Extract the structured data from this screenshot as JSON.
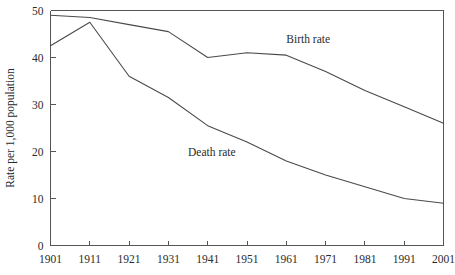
{
  "chart_data": {
    "type": "line",
    "title": "",
    "xlabel": "",
    "ylabel": "Rate per 1,000 population",
    "x": [
      1901,
      1911,
      1921,
      1931,
      1941,
      1951,
      1961,
      1971,
      1981,
      1991,
      2001
    ],
    "xtick_labels": [
      "1901",
      "1911",
      "1921",
      "1931",
      "1941",
      "1951",
      "1961",
      "1971",
      "1981",
      "1991",
      "2001"
    ],
    "ytick_labels": [
      "0",
      "10",
      "20",
      "30",
      "40",
      "50"
    ],
    "yticks": [
      0,
      10,
      20,
      30,
      40,
      50
    ],
    "ylim": [
      0,
      50
    ],
    "xlim": [
      1901,
      2001
    ],
    "grid": false,
    "legend_position": "inline-annotations",
    "series": [
      {
        "name": "Birth rate",
        "label": "Birth rate",
        "color": "#4a4a4a",
        "values": [
          49,
          48.5,
          47,
          45.5,
          40,
          41,
          40.5,
          37,
          33,
          29.5,
          26
        ],
        "annotation": {
          "text": "Birth rate",
          "x": 1961,
          "y": 43
        }
      },
      {
        "name": "Death rate",
        "label": "Death rate",
        "color": "#4a4a4a",
        "values": [
          42.5,
          47.5,
          36,
          31.5,
          25.5,
          22,
          18,
          15,
          12.5,
          10,
          9
        ],
        "annotation": {
          "text": "Death rate",
          "x": 1936,
          "y": 19
        }
      }
    ]
  },
  "figure": {
    "background_color": "#ffffff",
    "axis_color": "#555555",
    "text_color": "#2b2b2b"
  }
}
